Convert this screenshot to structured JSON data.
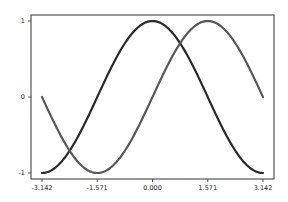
{
  "chart_data": {
    "type": "line",
    "title": "",
    "xlabel": "",
    "ylabel": "",
    "xlim": [
      -3.142,
      3.142
    ],
    "ylim": [
      -1,
      1
    ],
    "grid": false,
    "legend": null,
    "xticks": [
      -3.142,
      -1.571,
      0.0,
      1.571,
      3.142
    ],
    "xtick_labels": [
      "-3.142",
      "-1.571",
      "0.000",
      "1.571",
      "3.142"
    ],
    "yticks": [
      -1,
      0,
      1
    ],
    "ytick_labels": [
      "-1",
      "0",
      "1"
    ],
    "series": [
      {
        "name": "cos(x)",
        "color": "#2a2a2a",
        "function": "cos",
        "x": [
          -3.142,
          -2.356,
          -1.571,
          -0.785,
          0.0,
          0.785,
          1.571,
          2.356,
          3.142
        ],
        "values": [
          -1.0,
          -0.707,
          0.0,
          0.707,
          1.0,
          0.707,
          0.0,
          -0.707,
          -1.0
        ]
      },
      {
        "name": "sin(x)",
        "color": "#585858",
        "function": "sin",
        "x": [
          -3.142,
          -2.356,
          -1.571,
          -0.785,
          0.0,
          0.785,
          1.571,
          2.356,
          3.142
        ],
        "values": [
          0.0,
          -0.707,
          -1.0,
          -0.707,
          0.0,
          0.707,
          1.0,
          0.707,
          0.0
        ]
      }
    ]
  }
}
